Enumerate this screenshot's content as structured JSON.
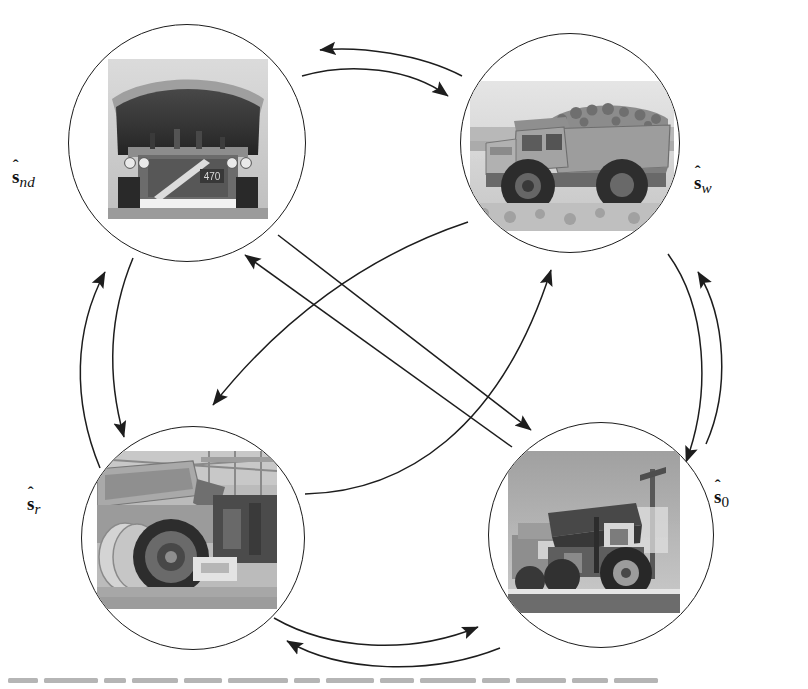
{
  "figure": {
    "type": "state-transition-diagram",
    "title": "",
    "background_color": "#ffffff",
    "stroke_color": "#1d1d1d",
    "node_count": 4,
    "edge_count": 12
  },
  "nodes": [
    {
      "id": "nd",
      "label_symbol": "s",
      "label_hat": "ˆ",
      "label_subscript": "nd",
      "label_text": "ŝ_nd",
      "position": "top-left",
      "label_position": "left",
      "cx": 187,
      "cy": 143,
      "r": 119,
      "photo": {
        "name": "haul-truck-front-view-photo",
        "description": "Front view of large mining haul truck with raised dump body",
        "x": 107,
        "y": 58,
        "w": 160,
        "h": 160
      }
    },
    {
      "id": "w",
      "label_symbol": "s",
      "label_hat": "ˆ",
      "label_subscript": "w",
      "label_text": "ŝ_w",
      "position": "top-right",
      "label_position": "right",
      "cx": 570,
      "cy": 143,
      "r": 110,
      "photo": {
        "name": "loaded-haul-truck-working-photo",
        "description": "Haul truck loaded with ore working on mine site",
        "x": 469,
        "y": 80,
        "w": 204,
        "h": 150
      }
    },
    {
      "id": "r",
      "label_symbol": "s",
      "label_hat": "ˆ",
      "label_subscript": "r",
      "label_text": "ŝ_r",
      "position": "bottom-left",
      "label_position": "left",
      "cx": 193,
      "cy": 538,
      "r": 112,
      "photo": {
        "name": "truck-in-maintenance-workshop-photo",
        "description": "Haul truck under repair in maintenance workshop with wheel removed",
        "x": 96,
        "y": 450,
        "w": 180,
        "h": 158
      }
    },
    {
      "id": "0",
      "label_symbol": "s",
      "label_hat": "ˆ",
      "label_subscript": "0",
      "label_text": "ŝ_0",
      "position": "bottom-right",
      "label_position": "right",
      "cx": 601,
      "cy": 535,
      "r": 113,
      "photo": {
        "name": "idle-trucks-parked-yard-photo",
        "description": "Haul trucks parked idle in yard",
        "x": 507,
        "y": 450,
        "w": 172,
        "h": 162
      }
    }
  ],
  "labels": {
    "nd": {
      "hat": "ˆ",
      "sym": "s",
      "sub": "nd",
      "x": 12,
      "y": 172
    },
    "w": {
      "hat": "ˆ",
      "sym": "s",
      "sub": "w",
      "x": 694,
      "y": 178
    },
    "r": {
      "hat": "ˆ",
      "sym": "s",
      "sub": "r",
      "x": 27,
      "y": 498
    },
    "0": {
      "hat": "ˆ",
      "sym": "s",
      "sub": "0",
      "x": 714,
      "y": 492
    }
  },
  "edges": [
    {
      "id": "w-to-nd",
      "from": "w",
      "to": "nd",
      "style": "arc",
      "side": "top",
      "direction": "left"
    },
    {
      "id": "nd-to-w",
      "from": "nd",
      "to": "w",
      "style": "arc",
      "side": "top",
      "direction": "right"
    },
    {
      "id": "r-to-nd",
      "from": "r",
      "to": "nd",
      "style": "arc",
      "side": "left",
      "direction": "up"
    },
    {
      "id": "nd-to-r",
      "from": "nd",
      "to": "r",
      "style": "arc",
      "side": "left",
      "direction": "down"
    },
    {
      "id": "0-to-w",
      "from": "0",
      "to": "w",
      "style": "arc",
      "side": "right",
      "direction": "up"
    },
    {
      "id": "w-to-0",
      "from": "w",
      "to": "0",
      "style": "arc",
      "side": "right",
      "direction": "down"
    },
    {
      "id": "r-to-0",
      "from": "r",
      "to": "0",
      "style": "arc",
      "side": "bottom",
      "direction": "right"
    },
    {
      "id": "0-to-r",
      "from": "0",
      "to": "r",
      "style": "arc",
      "side": "bottom",
      "direction": "left"
    },
    {
      "id": "0-to-nd",
      "from": "0",
      "to": "nd",
      "style": "straight",
      "side": "diagonal",
      "direction": "up-left"
    },
    {
      "id": "nd-to-0",
      "from": "nd",
      "to": "0",
      "style": "straight",
      "side": "diagonal",
      "direction": "down-right"
    },
    {
      "id": "r-to-w",
      "from": "r",
      "to": "w",
      "style": "arc",
      "side": "diagonal",
      "direction": "up-right"
    },
    {
      "id": "w-to-r",
      "from": "w",
      "to": "r",
      "style": "arc",
      "side": "diagonal",
      "direction": "down-left"
    }
  ]
}
